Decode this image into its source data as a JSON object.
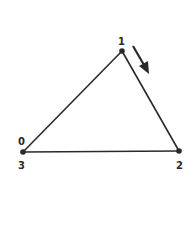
{
  "diagram": {
    "type": "triangle-graph",
    "vertices": [
      {
        "id": "top",
        "x": 122,
        "y": 51,
        "labels": [
          "1"
        ]
      },
      {
        "id": "left",
        "x": 23,
        "y": 152,
        "labels": [
          "0",
          "3"
        ]
      },
      {
        "id": "right",
        "x": 179,
        "y": 151,
        "labels": [
          "2"
        ]
      }
    ],
    "edges": [
      {
        "from": "left",
        "to": "top"
      },
      {
        "from": "top",
        "to": "right"
      },
      {
        "from": "right",
        "to": "left"
      }
    ],
    "arrow": {
      "direction": "from 1 toward 2",
      "x1": 133,
      "y1": 46,
      "x2": 148,
      "y2": 73
    },
    "labels": {
      "vertex_1": "1",
      "vertex_0": "0",
      "vertex_3": "3",
      "vertex_2": "2"
    },
    "colors": {
      "stroke": "#2a2a2a",
      "background": "#ffffff"
    }
  }
}
